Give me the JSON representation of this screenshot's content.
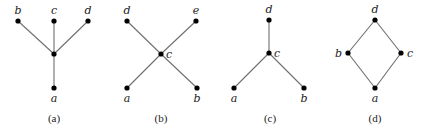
{
  "diagrams": [
    {
      "id": "a",
      "caption": "(a)",
      "caption_pos": [
        54,
        122
      ],
      "nodes": [
        {
          "name": "b",
          "x": 18,
          "y": 21,
          "label": "b",
          "lx": 18,
          "ly": 14,
          "anchor": "middle"
        },
        {
          "name": "c",
          "x": 54,
          "y": 21,
          "label": "c",
          "lx": 54,
          "ly": 14,
          "anchor": "middle"
        },
        {
          "name": "d",
          "x": 88,
          "y": 21,
          "label": "d",
          "lx": 88,
          "ly": 14,
          "anchor": "middle"
        },
        {
          "name": "center",
          "x": 54,
          "y": 54,
          "label": "",
          "lx": 0,
          "ly": 0,
          "anchor": "middle"
        },
        {
          "name": "a",
          "x": 54,
          "y": 88,
          "label": "a",
          "lx": 54,
          "ly": 102,
          "anchor": "middle"
        }
      ],
      "edges": [
        [
          "b",
          "center"
        ],
        [
          "c",
          "center"
        ],
        [
          "d",
          "center"
        ],
        [
          "center",
          "a"
        ]
      ]
    },
    {
      "id": "b",
      "caption": "(b)",
      "caption_pos": [
        161,
        122
      ],
      "nodes": [
        {
          "name": "d",
          "x": 127,
          "y": 21,
          "label": "d",
          "lx": 127,
          "ly": 14,
          "anchor": "middle"
        },
        {
          "name": "e",
          "x": 196,
          "y": 21,
          "label": "e",
          "lx": 196,
          "ly": 14,
          "anchor": "middle"
        },
        {
          "name": "c",
          "x": 161,
          "y": 54,
          "label": "c",
          "lx": 166,
          "ly": 58,
          "anchor": "start"
        },
        {
          "name": "a",
          "x": 127,
          "y": 88,
          "label": "a",
          "lx": 127,
          "ly": 102,
          "anchor": "middle"
        },
        {
          "name": "b",
          "x": 197,
          "y": 88,
          "label": "b",
          "lx": 197,
          "ly": 102,
          "anchor": "middle"
        }
      ],
      "edges": [
        [
          "d",
          "c"
        ],
        [
          "e",
          "c"
        ],
        [
          "c",
          "a"
        ],
        [
          "c",
          "b"
        ]
      ]
    },
    {
      "id": "c",
      "caption": "(c)",
      "caption_pos": [
        270,
        122
      ],
      "nodes": [
        {
          "name": "d",
          "x": 269,
          "y": 20,
          "label": "d",
          "lx": 269,
          "ly": 13,
          "anchor": "middle"
        },
        {
          "name": "c",
          "x": 269,
          "y": 53,
          "label": "c",
          "lx": 274,
          "ly": 57,
          "anchor": "start"
        },
        {
          "name": "a",
          "x": 234,
          "y": 88,
          "label": "a",
          "lx": 234,
          "ly": 102,
          "anchor": "middle"
        },
        {
          "name": "b",
          "x": 304,
          "y": 88,
          "label": "b",
          "lx": 304,
          "ly": 102,
          "anchor": "middle"
        }
      ],
      "edges": [
        [
          "d",
          "c"
        ],
        [
          "c",
          "a"
        ],
        [
          "c",
          "b"
        ]
      ]
    },
    {
      "id": "d",
      "caption": "(d)",
      "caption_pos": [
        375,
        122
      ],
      "nodes": [
        {
          "name": "d",
          "x": 375,
          "y": 20,
          "label": "d",
          "lx": 375,
          "ly": 13,
          "anchor": "middle"
        },
        {
          "name": "b",
          "x": 348,
          "y": 53,
          "label": "b",
          "lx": 342,
          "ly": 57,
          "anchor": "end"
        },
        {
          "name": "c",
          "x": 401,
          "y": 53,
          "label": "c",
          "lx": 407,
          "ly": 57,
          "anchor": "start"
        },
        {
          "name": "a",
          "x": 375,
          "y": 88,
          "label": "a",
          "lx": 375,
          "ly": 102,
          "anchor": "middle"
        }
      ],
      "edges": [
        [
          "d",
          "b"
        ],
        [
          "d",
          "c"
        ],
        [
          "b",
          "a"
        ],
        [
          "c",
          "a"
        ]
      ]
    }
  ],
  "style": {
    "node_color": "#000000",
    "edge_color": "#6e6e6e",
    "text_color": "#222222",
    "node_radius": 2.6
  }
}
